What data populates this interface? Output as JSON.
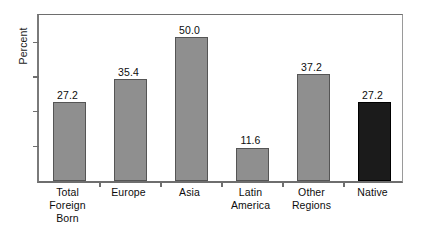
{
  "chart_data": {
    "type": "bar",
    "title": "",
    "subtitle": "",
    "xlabel": "",
    "ylabel": "Percent",
    "categories": [
      "Total Foreign Born",
      "Europe",
      "Asia",
      "Latin America",
      "Other Regions",
      "Native"
    ],
    "category_label_lines": [
      [
        "Total",
        "Foreign",
        "Born"
      ],
      [
        "Europe"
      ],
      [
        "Asia"
      ],
      [
        "Latin",
        "America"
      ],
      [
        "Other",
        "Regions"
      ],
      [
        "Native"
      ]
    ],
    "values": [
      27.2,
      35.4,
      50.0,
      11.6,
      37.2,
      27.2
    ],
    "value_labels": [
      "27.2",
      "35.4",
      "50.0",
      "11.6",
      "37.2",
      "27.2"
    ],
    "bar_colors": [
      "#8f8f8f",
      "#8f8f8f",
      "#8f8f8f",
      "#8f8f8f",
      "#8f8f8f",
      "#1b1b1b"
    ],
    "bar_styles": [
      "gray",
      "gray",
      "gray",
      "gray",
      "gray",
      "black"
    ],
    "ylim": [
      0,
      58.5
    ],
    "y_tick_values": [
      0,
      12,
      24,
      36,
      48
    ],
    "y_tick_labels": [
      "",
      "",
      "",
      "",
      ""
    ],
    "grid": false,
    "legend": null,
    "legend_position": "none",
    "frame": true,
    "accent_gray": "#8f8f8f",
    "accent_black": "#1b1b1b",
    "axis_color": "#6e6e6e"
  }
}
